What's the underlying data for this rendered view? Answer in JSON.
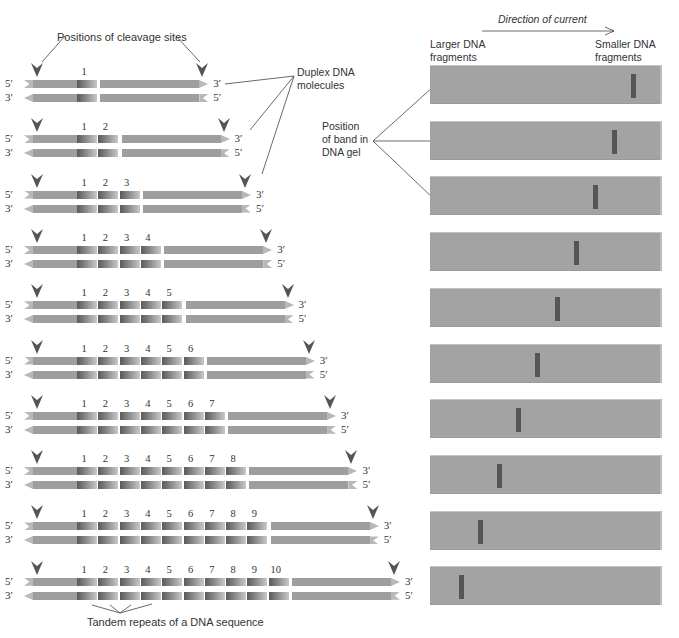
{
  "labels": {
    "cleavage_sites": "Positions of cleavage sites",
    "duplex_dna": [
      "Duplex DNA",
      "molecules"
    ],
    "position_band": [
      "Position",
      "of band in",
      "DNA gel"
    ],
    "direction": "Direction of current",
    "larger": [
      "Larger DNA",
      "fragments"
    ],
    "smaller": [
      "Smaller DNA",
      "fragments"
    ],
    "tandem": "Tandem repeats of a DNA sequence"
  },
  "strand_ends": {
    "top_left": "5′",
    "top_right": "3′",
    "bottom_left": "3′",
    "bottom_right": "5′"
  },
  "colors": {
    "strand": "#9e9e9e",
    "repeat_dark": "#5a5a5a",
    "gel": "#a3a3a3",
    "band": "#555555",
    "cut_arrow": "#555555"
  },
  "rows": [
    {
      "repeats": 1,
      "numbers": [
        "1"
      ]
    },
    {
      "repeats": 2,
      "numbers": [
        "1",
        "2"
      ]
    },
    {
      "repeats": 3,
      "numbers": [
        "1",
        "2",
        "3"
      ]
    },
    {
      "repeats": 4,
      "numbers": [
        "1",
        "2",
        "3",
        "4"
      ]
    },
    {
      "repeats": 5,
      "numbers": [
        "1",
        "2",
        "3",
        "4",
        "5"
      ]
    },
    {
      "repeats": 6,
      "numbers": [
        "1",
        "2",
        "3",
        "4",
        "5",
        "6"
      ]
    },
    {
      "repeats": 7,
      "numbers": [
        "1",
        "2",
        "3",
        "4",
        "5",
        "6",
        "7"
      ]
    },
    {
      "repeats": 8,
      "numbers": [
        "1",
        "2",
        "3",
        "4",
        "5",
        "6",
        "7",
        "8"
      ]
    },
    {
      "repeats": 9,
      "numbers": [
        "1",
        "2",
        "3",
        "4",
        "5",
        "6",
        "7",
        "8",
        "9"
      ]
    },
    {
      "repeats": 10,
      "numbers": [
        "1",
        "2",
        "3",
        "4",
        "5",
        "6",
        "7",
        "8",
        "9",
        "10"
      ]
    }
  ],
  "gel": {
    "lanes": 10,
    "band_positions_px": [
      631,
      612,
      593,
      574,
      555,
      535,
      516,
      497,
      478,
      459
    ]
  }
}
